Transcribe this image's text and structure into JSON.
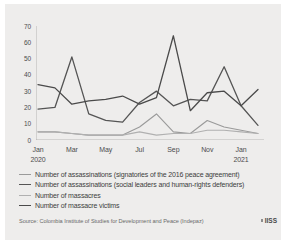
{
  "chart_data": {
    "type": "line",
    "title": "",
    "subtitle": "",
    "xlabel": "",
    "ylabel": "",
    "ylim": [
      0,
      70
    ],
    "ytick_values": [
      0,
      10,
      20,
      30,
      40,
      50,
      60,
      70
    ],
    "ytick_labels": [
      "0",
      "10",
      "20",
      "30",
      "40",
      "50",
      "60",
      "70"
    ],
    "grid": false,
    "legend_position": "below",
    "x": [
      "Jan 2020",
      "Feb 2020",
      "Mar 2020",
      "Apr 2020",
      "May 2020",
      "Jun 2020",
      "Jul 2020",
      "Aug 2020",
      "Sep 2020",
      "Oct 2020",
      "Nov 2020",
      "Dec 2020",
      "Jan 2021",
      "Feb 2021"
    ],
    "xtick_labels": [
      "Jan",
      "Mar",
      "May",
      "Jul",
      "Sep",
      "Nov",
      "Jan"
    ],
    "xtick_sublabels": [
      "2020",
      "",
      "",
      "",
      "",
      "",
      "2021"
    ],
    "xtick_indices": [
      0,
      2,
      4,
      6,
      8,
      10,
      12
    ],
    "series": [
      {
        "name": "Number of assassinations (signatories of the 2016 peace agreement)",
        "color": "#9a9a9a",
        "values": [
          8,
          6,
          6,
          5,
          9,
          3,
          4,
          8,
          5,
          4,
          6,
          8,
          7,
          5
        ]
      },
      {
        "name": "Number of assassinations (social leaders and human-rights defenders)",
        "color": "#555555",
        "values": [
          19,
          20,
          51,
          16,
          12,
          11,
          23,
          30,
          21,
          25,
          24,
          45,
          21,
          9
        ]
      },
      {
        "name": "Number of massacres",
        "color": "#b0b0b0",
        "values": [
          5,
          5,
          4,
          3,
          3,
          3,
          5,
          3,
          4,
          4,
          6,
          6,
          5,
          4
        ]
      },
      {
        "name": "Number of massacre victims",
        "color": "#4a4a4a",
        "values": [
          34,
          32,
          22,
          24,
          25,
          27,
          22,
          26,
          64,
          18,
          29,
          30,
          21,
          31
        ]
      }
    ],
    "light_series_overlay": {
      "name": "Number of massacres (peak shape)",
      "values": [
        5,
        5,
        4,
        3,
        3,
        3,
        8,
        16,
        5,
        4,
        12,
        8,
        6,
        4
      ]
    }
  },
  "legend": {
    "items": [
      {
        "label": "Number of assassinations (signatories of the 2016 peace agreement)",
        "color": "#9a9a9a"
      },
      {
        "label": "Number of assassinations (social leaders and human-rights defenders)",
        "color": "#555555"
      },
      {
        "label": "Number of massacres",
        "color": "#b0b0b0"
      },
      {
        "label": "Number of massacre victims",
        "color": "#4a4a4a"
      }
    ]
  },
  "footer": {
    "source": "Source: Colombia Institute of Studies for Development and Peace (Indepaz)",
    "logo_text": "IISS"
  },
  "colors": {
    "background": "#eeedec",
    "page": "#ffffff",
    "axis": "#a8a8a8",
    "tick_text": "#4c4c4c",
    "legend_text": "#3d3d3d",
    "source_text": "#6a6a6a"
  }
}
